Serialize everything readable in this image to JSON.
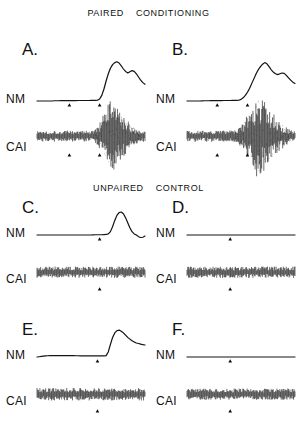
{
  "figure": {
    "background_color": "#ffffff",
    "ink_color": "#141414",
    "sections": [
      {
        "id": "paired",
        "words": [
          "Paired",
          "Conditioning"
        ]
      },
      {
        "id": "unpaired",
        "words": [
          "Unpaired",
          "Control"
        ]
      }
    ]
  },
  "labels": {
    "nm": "NM",
    "ca1": "CAI"
  },
  "panels": [
    {
      "letter": "A.",
      "group": "Paired Conditioning",
      "nm_response": "large conditioned response",
      "ca1_response": "burst",
      "markers": 2
    },
    {
      "letter": "B.",
      "group": "Paired Conditioning",
      "nm_response": "large conditioned response",
      "ca1_response": "burst",
      "markers": 2
    },
    {
      "letter": "C.",
      "group": "Unpaired Control",
      "nm_response": "small biphasic reflex",
      "ca1_response": "baseline",
      "markers": 1
    },
    {
      "letter": "D.",
      "group": "Unpaired Control",
      "nm_response": "flat",
      "ca1_response": "baseline",
      "markers": 1
    },
    {
      "letter": "E.",
      "group": "Unpaired Control",
      "nm_response": "reflex response",
      "ca1_response": "baseline",
      "markers": 1
    },
    {
      "letter": "F.",
      "group": "Unpaired Control",
      "nm_response": "flat",
      "ca1_response": "baseline",
      "markers": 1
    }
  ],
  "chart_data": {
    "type": "line",
    "title": "",
    "xlabel": "",
    "ylabel": "",
    "x": [
      0,
      2,
      4,
      6,
      8,
      10,
      12,
      14,
      16,
      18,
      20,
      22,
      24,
      26,
      28,
      30,
      32,
      34,
      36,
      38,
      40,
      42,
      44,
      46,
      48,
      50,
      52,
      54,
      56,
      58,
      60,
      62,
      64,
      66,
      68,
      70,
      72,
      74,
      76,
      78,
      80,
      82,
      84,
      86,
      88,
      90,
      92,
      94,
      96,
      98,
      100
    ],
    "panels": [
      {
        "letter": "A.",
        "nm": {
          "name": "NM",
          "marker_x": [
            30,
            58
          ],
          "values": [
            0,
            0,
            0,
            0,
            0,
            0,
            0,
            0,
            0.5,
            0.6,
            0.7,
            0.8,
            0.8,
            0.9,
            1,
            1,
            1,
            1.1,
            1.1,
            1.2,
            1.2,
            1.2,
            1.3,
            1.3,
            1.3,
            1.4,
            1.4,
            1.5,
            2,
            5,
            14,
            30,
            50,
            68,
            82,
            91,
            96,
            98,
            95,
            88,
            80,
            74,
            70,
            73,
            76,
            74,
            68,
            60,
            52,
            46,
            42
          ]
        },
        "ca1": {
          "name": "CAI",
          "marker_x": [
            30,
            58
          ],
          "baseline_amplitude": 9,
          "burst_start_x": 52,
          "burst_peak_x": 68,
          "burst_peak_amplitude": 62,
          "burst_end_x": 96
        }
      },
      {
        "letter": "B.",
        "nm": {
          "name": "NM",
          "marker_x": [
            28,
            56
          ],
          "values": [
            0,
            0,
            0,
            0,
            0,
            0,
            0,
            0.4,
            0.5,
            0.6,
            0.7,
            0.8,
            0.9,
            1,
            1,
            1.1,
            1.1,
            1.2,
            1.2,
            1.3,
            1.3,
            1.4,
            1.4,
            1.5,
            2,
            4,
            8,
            14,
            22,
            32,
            44,
            56,
            68,
            78,
            86,
            92,
            96,
            93,
            86,
            78,
            72,
            68,
            66,
            68,
            70,
            69,
            64,
            58,
            52,
            47,
            44
          ]
        },
        "ca1": {
          "name": "CAI",
          "marker_x": [
            28,
            56
          ],
          "baseline_amplitude": 9,
          "burst_start_x": 44,
          "burst_peak_x": 66,
          "burst_peak_amplitude": 70,
          "burst_end_x": 98
        }
      },
      {
        "letter": "C.",
        "nm": {
          "name": "NM",
          "marker_x": [
            58
          ],
          "values": [
            0,
            0,
            0,
            0,
            0,
            0,
            0,
            0,
            0,
            0,
            0,
            0,
            0,
            0,
            0,
            0,
            0,
            0,
            0,
            0,
            0,
            0,
            0,
            0,
            0,
            0,
            0.5,
            1,
            1,
            1,
            1,
            1.5,
            2,
            4,
            12,
            30,
            52,
            70,
            80,
            82,
            76,
            62,
            44,
            26,
            12,
            4,
            0,
            -6,
            -9,
            -8,
            -4
          ]
        },
        "ca1": {
          "name": "CAI",
          "marker_x": [
            58
          ],
          "baseline_amplitude": 10,
          "burst_start_x": null,
          "burst_peak_x": null,
          "burst_peak_amplitude": 0,
          "burst_end_x": null
        }
      },
      {
        "letter": "D.",
        "nm": {
          "name": "NM",
          "marker_x": [
            40
          ],
          "values": [
            0,
            0,
            0,
            0,
            0,
            0,
            0,
            0,
            0,
            0,
            0,
            0,
            0,
            0,
            0,
            0,
            0,
            0,
            0,
            0,
            0,
            0,
            0,
            0,
            0,
            0,
            0,
            0,
            0,
            0,
            0,
            0,
            0,
            0,
            0,
            0,
            0,
            0,
            0,
            0,
            0,
            0,
            0,
            0,
            0,
            0,
            0,
            0,
            0,
            0,
            0
          ]
        },
        "ca1": {
          "name": "CAI",
          "marker_x": [
            40
          ],
          "baseline_amplitude": 10,
          "burst_start_x": null,
          "burst_peak_x": null,
          "burst_peak_amplitude": 0,
          "burst_end_x": null
        }
      },
      {
        "letter": "E.",
        "nm": {
          "name": "NM",
          "marker_x": [
            56
          ],
          "values": [
            0,
            1,
            2,
            3,
            4,
            4.5,
            5,
            5,
            5,
            5,
            5,
            5,
            5,
            5,
            5,
            5,
            5,
            5,
            4.5,
            4.5,
            4,
            4,
            4,
            4,
            4,
            4,
            4,
            4,
            4,
            4,
            4,
            4,
            5,
            18,
            45,
            70,
            86,
            94,
            96,
            92,
            86,
            78,
            70,
            64,
            58,
            54,
            50,
            48,
            46,
            44,
            43
          ]
        },
        "ca1": {
          "name": "CAI",
          "marker_x": [
            56
          ],
          "baseline_amplitude": 11,
          "burst_start_x": null,
          "burst_peak_x": null,
          "burst_peak_amplitude": 0,
          "burst_end_x": null
        }
      },
      {
        "letter": "F.",
        "nm": {
          "name": "NM",
          "marker_x": [
            40
          ],
          "values": [
            0,
            0,
            0,
            0,
            0,
            0,
            0,
            0,
            0,
            0,
            0,
            0,
            0,
            0,
            0,
            0,
            0,
            0,
            0,
            0,
            0,
            0,
            0,
            0,
            0,
            0,
            0,
            0,
            0,
            0,
            0,
            0,
            0,
            0,
            0,
            0,
            0,
            0,
            0,
            0,
            0,
            0,
            0,
            0,
            0,
            0,
            0,
            0,
            0,
            0,
            0
          ]
        },
        "ca1": {
          "name": "CAI",
          "marker_x": [
            40
          ],
          "baseline_amplitude": 10,
          "burst_start_x": null,
          "burst_peak_x": null,
          "burst_peak_amplitude": 0,
          "burst_end_x": null
        }
      }
    ]
  }
}
